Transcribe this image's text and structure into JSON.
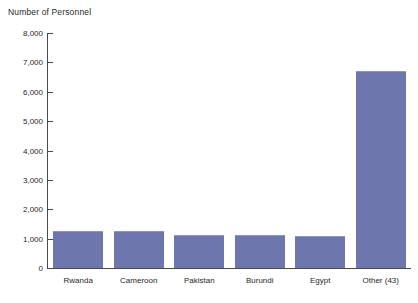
{
  "chart_data": {
    "type": "bar",
    "title": "Number of Personnel",
    "xlabel": "",
    "ylabel": "Number of Personnel",
    "categories": [
      "Rwanda",
      "Cameroon",
      "Pakistan",
      "Burundi",
      "Egypt",
      "Other (43)"
    ],
    "values": [
      1230,
      1230,
      1100,
      1100,
      1050,
      6680
    ],
    "ylim": [
      0,
      8000
    ],
    "ytick_values": [
      0,
      1000,
      2000,
      3000,
      4000,
      5000,
      6000,
      7000,
      8000
    ],
    "ytick_labels": [
      "0",
      "1,000",
      "2,000",
      "3,000",
      "4,000",
      "5,000",
      "6,000",
      "7,000",
      "8,000"
    ],
    "grid": false,
    "legend": null,
    "series": [
      {
        "name": "Number of Personnel",
        "values": [
          1230,
          1230,
          1100,
          1100,
          1050,
          6680
        ]
      }
    ],
    "colors": {
      "bar_fill": "#6e76ae",
      "bar_top_highlight": "#8d93c2",
      "axis": "#4a4a4a",
      "text": "#1f1f1f",
      "background": "#ffffff"
    }
  }
}
